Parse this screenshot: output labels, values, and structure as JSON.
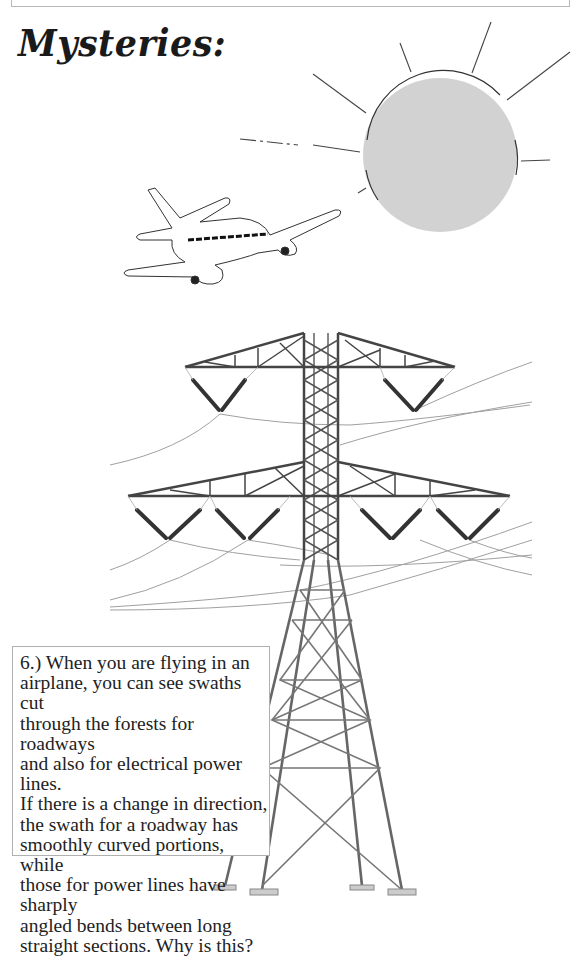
{
  "page": {
    "title": "Mysteries:",
    "question": {
      "number": "6.)",
      "text": "6.)  When you are flying in an\nairplane, you can see swaths cut\nthrough the forests for roadways\nand also for electrical power lines.\nIf there is a change in direction,\nthe swath for a roadway has\nsmoothly curved portions, while\nthose for power lines have sharply\nangled bends between long\nstraight sections.  Why is this?"
    }
  },
  "illustrations": {
    "sun": {
      "icon": "sun-icon",
      "fill": "#d0d0d0",
      "stroke": "#333333"
    },
    "airplane": {
      "icon": "airplane-icon"
    },
    "tower": {
      "icon": "power-tower-icon",
      "stroke": "#444444"
    }
  },
  "colors": {
    "ink": "#222222",
    "wire": "#9a9a9a",
    "frame": "#b8b8b8"
  }
}
